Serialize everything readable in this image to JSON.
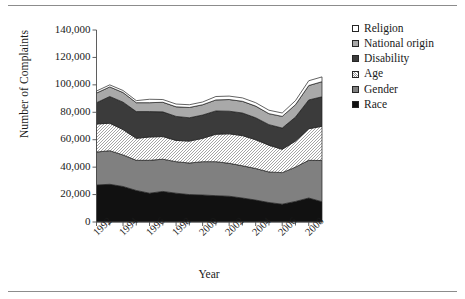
{
  "figure": {
    "has_top_rule": true,
    "has_bottom_rule": true,
    "background": "#ffffff"
  },
  "legend": {
    "position": "right",
    "items": [
      {
        "label": "Religion",
        "color": "#ffffff",
        "pattern": "solid"
      },
      {
        "label": "National origin",
        "color": "#a9a9a9",
        "pattern": "solid"
      },
      {
        "label": "Disability",
        "color": "#3b3b3b",
        "pattern": "solid"
      },
      {
        "label": "Age",
        "color": "#ffffff",
        "pattern": "hatch"
      },
      {
        "label": "Gender",
        "color": "#808080",
        "pattern": "solid"
      },
      {
        "label": "Race",
        "color": "#111111",
        "pattern": "solid"
      }
    ]
  },
  "chart_data": {
    "type": "area",
    "stacked": true,
    "title": "",
    "xlabel": "Year",
    "ylabel": "Number of Complaints",
    "xlim": [
      1992,
      2009
    ],
    "ylim": [
      0,
      140000
    ],
    "ytick_values": [
      0,
      20000,
      40000,
      60000,
      80000,
      100000,
      120000,
      140000
    ],
    "ytick_labels": [
      "0",
      "20,000",
      "40,000",
      "60,000",
      "80,000",
      "100,000",
      "120,000",
      "140,000"
    ],
    "xtick_values": [
      1992,
      1994,
      1996,
      1998,
      2000,
      2002,
      2004,
      2006,
      2008
    ],
    "xtick_labels": [
      "1992",
      "1994",
      "1996",
      "1998",
      "2000",
      "2002",
      "2004",
      "2006",
      "2008"
    ],
    "grid": false,
    "x": [
      1992,
      1993,
      1994,
      1995,
      1996,
      1997,
      1998,
      1999,
      2000,
      2001,
      2002,
      2003,
      2004,
      2005,
      2006,
      2007,
      2008,
      2009
    ],
    "series": [
      {
        "name": "Race",
        "color": "#111111",
        "pattern": "solid",
        "values": [
          27000,
          27500,
          25900,
          23000,
          21000,
          22300,
          21000,
          20000,
          19700,
          19200,
          18800,
          17500,
          16000,
          14200,
          13000,
          15000,
          17500,
          14800
        ]
      },
      {
        "name": "Gender",
        "color": "#808080",
        "pattern": "solid",
        "values": [
          24000,
          24500,
          23000,
          22000,
          24000,
          23500,
          23000,
          23000,
          24300,
          24800,
          24000,
          23500,
          23000,
          22300,
          23000,
          25000,
          27500,
          30000
        ]
      },
      {
        "name": "Age",
        "color": "#ffffff",
        "pattern": "hatch",
        "values": [
          20500,
          20000,
          18500,
          16000,
          17000,
          16500,
          15500,
          16000,
          17000,
          20000,
          21500,
          22000,
          21000,
          19500,
          17000,
          19000,
          23000,
          25000
        ]
      },
      {
        "name": "Disability",
        "color": "#3b3b3b",
        "pattern": "solid",
        "values": [
          15500,
          19500,
          20000,
          19500,
          18500,
          18000,
          17500,
          17000,
          17000,
          17000,
          16500,
          16500,
          16000,
          15000,
          15500,
          17500,
          21000,
          21500
        ]
      },
      {
        "name": "National origin",
        "color": "#a9a9a9",
        "pattern": "solid",
        "values": [
          7000,
          7000,
          7000,
          6500,
          6500,
          7000,
          7000,
          7500,
          7500,
          8000,
          8500,
          8500,
          8500,
          8000,
          8500,
          9000,
          10500,
          11000
        ]
      },
      {
        "name": "Religion",
        "color": "#ffffff",
        "pattern": "solid",
        "values": [
          1500,
          1500,
          1500,
          1500,
          2500,
          2000,
          2000,
          2000,
          2000,
          2500,
          2500,
          2500,
          2500,
          2500,
          2500,
          3000,
          3500,
          3500
        ]
      }
    ]
  }
}
